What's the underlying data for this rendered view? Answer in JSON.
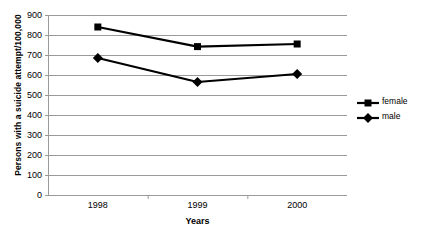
{
  "chart_data": {
    "type": "line",
    "title": "",
    "xlabel": "Years",
    "ylabel": "Persons with a suicide attempt/100,000",
    "categories": [
      "1998",
      "1999",
      "2000"
    ],
    "series": [
      {
        "name": "female",
        "marker": "square",
        "color": "#000000",
        "values": [
          840,
          742,
          755
        ]
      },
      {
        "name": "male",
        "marker": "diamond",
        "color": "#000000",
        "values": [
          685,
          565,
          605
        ]
      }
    ],
    "ylim": [
      0,
      900
    ],
    "ytick_step": 100,
    "yticks": [
      "900",
      "800",
      "700",
      "600",
      "500",
      "400",
      "300",
      "200",
      "100",
      "0"
    ],
    "grid": true,
    "legend_position": "right"
  },
  "legend": {
    "items": [
      {
        "label": "female"
      },
      {
        "label": "male"
      }
    ]
  }
}
